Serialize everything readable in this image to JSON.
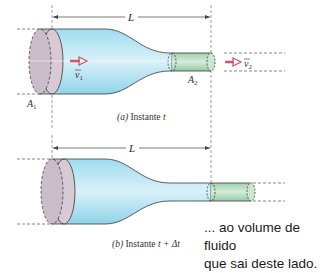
{
  "diagram": {
    "panel_a": {
      "length_label": "L",
      "area_in_label": "A",
      "area_in_sub": "1",
      "area_out_label": "A",
      "area_out_sub": "2",
      "velocity_in_label": "v",
      "velocity_in_sub": "1",
      "velocity_out_label": "v",
      "velocity_out_sub": "2",
      "caption_letter": "(a)",
      "caption_text": " Instante ",
      "caption_time": "t"
    },
    "panel_b": {
      "length_label": "L",
      "caption_letter": "(b)",
      "caption_text": " Instante ",
      "caption_time": "t + Δt"
    },
    "annotation": {
      "line1": "... ao volume de fluido",
      "line2": "que sai deste lado."
    },
    "colors": {
      "fluid": "#bfe6f2",
      "fluid_dark": "#8fd3ea",
      "inlet_disk": "#cdbfcc",
      "outlet_volume": "#a9d6b3",
      "arrow": "#d9536a",
      "outline": "#3a3a3a"
    }
  }
}
